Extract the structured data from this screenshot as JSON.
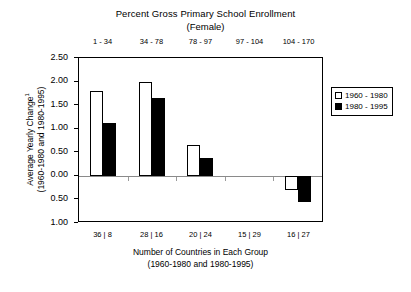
{
  "chart_data": {
    "type": "bar",
    "title": "Percent Gross Primary School Enrollment",
    "subtitle": "(Female)",
    "xlabel": "Number of Countries in Each Group",
    "xlabel2": "(1960-1980 and 1980-1995)",
    "ylabel": "Average Yearly Change",
    "ylabel_superscript": "1",
    "ylabel2": "(1960-1980 and 1980-1995)",
    "categories": [
      "1 - 34",
      "34 - 78",
      "78 - 97",
      "97 - 104",
      "104 - 170"
    ],
    "category_axis_label_top": "Percent Gross Primary School Enrollment (Female)",
    "group_counts": [
      "36 | 8",
      "28 | 16",
      "20 | 24",
      "15 | 29",
      "16 | 27"
    ],
    "series": [
      {
        "name": "1960 - 1980",
        "color": "#ffffff",
        "edge": "#000000",
        "values": [
          1.8,
          2.0,
          0.65,
          0.0,
          -0.3
        ]
      },
      {
        "name": "1980 - 1995",
        "color": "#000000",
        "edge": "#000000",
        "values": [
          1.12,
          1.65,
          0.38,
          0.0,
          -0.55
        ]
      }
    ],
    "ylim": [
      -1.0,
      2.5
    ],
    "yticks": [
      2.5,
      2.0,
      1.5,
      1.0,
      0.5,
      0.0,
      -0.5,
      -1.0
    ],
    "ytick_labels": [
      "2.50",
      "2.00",
      "1.50",
      "1.00",
      "0.50",
      "0.00",
      "0.50",
      "1.00"
    ],
    "grid": false,
    "legend_position": "right"
  },
  "legend": {
    "items": [
      {
        "label": "1960 - 1980",
        "style": "light"
      },
      {
        "label": "1980 - 1995",
        "style": "dark"
      }
    ]
  }
}
